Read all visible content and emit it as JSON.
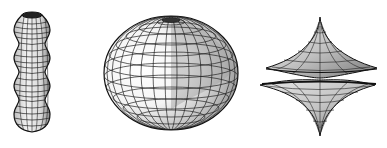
{
  "figures": [
    {
      "name": "surface-of-revolution-undulating-cylinder",
      "description": "Wireframe vase-like surface of revolution with four bulges"
    },
    {
      "name": "ellipsoid",
      "description": "Wireframe shaded oblate ellipsoid with latitude/longitude grid"
    },
    {
      "name": "astroidal-surface",
      "description": "Wireframe star-shaped astroid surface of revolution with cusps"
    }
  ],
  "colors": {
    "background": "#ffffff",
    "line": "#111111",
    "shade": "#9a9a9a"
  }
}
